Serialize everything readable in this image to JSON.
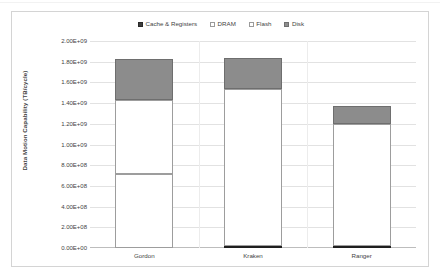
{
  "chart_data": {
    "type": "bar",
    "stacked": true,
    "title": "",
    "xlabel": "",
    "ylabel": "Data Motion Capability (TB/cycle)",
    "categories": [
      "Gordon",
      "Kraken",
      "Ranger"
    ],
    "series": [
      {
        "name": "Cache & Registers",
        "color": "#2f2f2f",
        "values": [
          0,
          20000000,
          20000000
        ]
      },
      {
        "name": "DRAM",
        "color": "#ffffff",
        "values": [
          715000000,
          0,
          0
        ]
      },
      {
        "name": "Flash",
        "color": "#ffffff",
        "values": [
          715000000,
          1520000000,
          1180000000
        ]
      },
      {
        "name": "Disk",
        "color": "#8c8c8c",
        "values": [
          400000000,
          300000000,
          170000000
        ]
      }
    ],
    "totals": [
      1830000000,
      1840000000,
      1370000000
    ],
    "ylim": [
      0,
      2000000000
    ],
    "ytick_values": [
      0,
      200000000,
      400000000,
      600000000,
      800000000,
      1000000000,
      1200000000,
      1400000000,
      1600000000,
      1800000000,
      2000000000
    ],
    "ytick_labels": [
      "0.00E+00",
      "2.00E+08",
      "4.00E+08",
      "6.00E+08",
      "8.00E+08",
      "1.00E+09",
      "1.20E+09",
      "1.40E+09",
      "1.60E+09",
      "1.80E+09",
      "2.00E+09"
    ],
    "grid": true,
    "legend_position": "top-center",
    "legend": [
      {
        "label": "Cache & Registers",
        "swatch": "filled-dark"
      },
      {
        "label": "DRAM",
        "swatch": "outline-white"
      },
      {
        "label": "Flash",
        "swatch": "outline-white"
      },
      {
        "label": "Disk",
        "swatch": "filled-gray"
      }
    ]
  },
  "colors": {
    "disk": "#8c8c8c",
    "cache": "#2f2f2f",
    "outline": "#9d9d9d",
    "gridline": "#e2e2e2",
    "frame": "#d4d4d4",
    "text": "#3f3f3f"
  }
}
